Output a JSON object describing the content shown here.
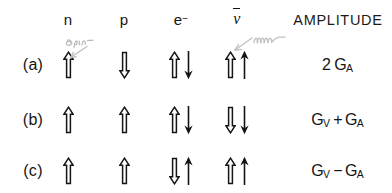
{
  "figure": {
    "columns": [
      {
        "key": "row",
        "label": ""
      },
      {
        "key": "n",
        "label": "n"
      },
      {
        "key": "p",
        "label": "p"
      },
      {
        "key": "e",
        "label": "e",
        "superscript": "−"
      },
      {
        "key": "nubar",
        "label": "ν",
        "overbar": true
      },
      {
        "key": "amp",
        "label": "AMPLITUDE"
      }
    ],
    "rows": [
      {
        "label": "(a)",
        "n": {
          "arrows": [
            "hollow-up"
          ]
        },
        "p": {
          "arrows": [
            "hollow-down"
          ]
        },
        "e": {
          "arrows": [
            "hollow-up",
            "solid-down"
          ]
        },
        "nubar": {
          "arrows": [
            "hollow-up",
            "solid-up"
          ]
        },
        "amplitude": {
          "coefficient": "2",
          "terms": [
            {
              "symbol": "G",
              "subscript": "A"
            }
          ],
          "text": "2 G_A"
        }
      },
      {
        "label": "(b)",
        "n": {
          "arrows": [
            "hollow-up"
          ]
        },
        "p": {
          "arrows": [
            "hollow-up"
          ]
        },
        "e": {
          "arrows": [
            "hollow-up",
            "solid-down"
          ]
        },
        "nubar": {
          "arrows": [
            "hollow-down",
            "solid-down"
          ]
        },
        "amplitude": {
          "coefficient": "",
          "operator": "+",
          "terms": [
            {
              "symbol": "G",
              "subscript": "V"
            },
            {
              "symbol": "G",
              "subscript": "A"
            }
          ],
          "text": "G_V + G_A"
        }
      },
      {
        "label": "(c)",
        "n": {
          "arrows": [
            "hollow-up"
          ]
        },
        "p": {
          "arrows": [
            "hollow-up"
          ]
        },
        "e": {
          "arrows": [
            "hollow-down",
            "solid-up"
          ]
        },
        "nubar": {
          "arrows": [
            "hollow-up",
            "solid-up"
          ]
        },
        "amplitude": {
          "coefficient": "",
          "operator": "−",
          "terms": [
            {
              "symbol": "G",
              "subscript": "V"
            },
            {
              "symbol": "G",
              "subscript": "A"
            }
          ],
          "text": "G_V - G_A"
        }
      }
    ],
    "annotations": [
      {
        "name": "pencil-note-spin",
        "text": "spin",
        "color": "#b9b9b9",
        "points_to": "n-column-row-a"
      },
      {
        "name": "pencil-note-momentum",
        "text": "mom",
        "color": "#bdbdbd",
        "points_to": "nubar-column-row-a"
      }
    ],
    "legend": {
      "hollow-up": "open outline arrow pointing up (spin)",
      "hollow-down": "open outline arrow pointing down (spin)",
      "solid-up": "thin solid arrow pointing up (momentum)",
      "solid-down": "thin solid arrow pointing down (momentum)"
    },
    "colors": {
      "ink": "#141414",
      "pencil": "#bbbbbb",
      "background": "#ffffff"
    }
  }
}
